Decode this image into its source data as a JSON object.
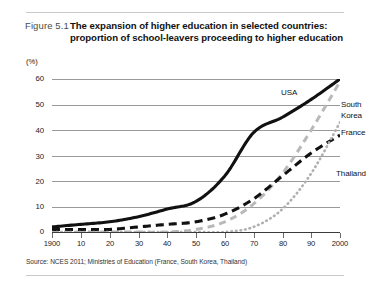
{
  "figure": {
    "number": "Figure 5.1",
    "title_line1": "The expansion of higher education in selected countries:",
    "title_line2": "proportion of school-leavers proceeding to higher education",
    "source": "Source: NCES 2011; Ministries of Education (France, South Korea, Thailand)"
  },
  "chart_data": {
    "type": "line",
    "xlabel": "",
    "ylabel": "(%)",
    "y_unit": "(%)",
    "xlim": [
      1900,
      2000
    ],
    "ylim": [
      0,
      60
    ],
    "grid": true,
    "legend_position": "inline-right",
    "yticks": [
      0,
      10,
      20,
      30,
      40,
      50,
      60
    ],
    "ytick_labels": [
      "0",
      "10",
      "20",
      "30",
      "40",
      "50",
      "60"
    ],
    "xticks": [
      1900,
      1910,
      1920,
      1930,
      1940,
      1950,
      1960,
      1970,
      1980,
      1990,
      2000
    ],
    "xtick_labels": [
      "1900",
      "10",
      "20",
      "30",
      "40",
      "50",
      "60",
      "70",
      "80",
      "90",
      "2000"
    ],
    "series": [
      {
        "name": "USA",
        "style": "solid",
        "color": "#111111",
        "x": [
          1900,
          1910,
          1920,
          1930,
          1940,
          1950,
          1960,
          1970,
          1980,
          1990,
          2000
        ],
        "values": [
          2,
          3,
          4,
          6,
          9,
          12,
          22,
          39,
          45,
          52,
          60
        ]
      },
      {
        "name": "South Korea",
        "style": "dashed",
        "color": "#b5b5b5",
        "x": [
          1900,
          1910,
          1920,
          1930,
          1940,
          1950,
          1960,
          1970,
          1980,
          1990,
          2000
        ],
        "values": [
          0,
          0,
          0,
          0,
          0,
          1,
          4,
          11,
          23,
          40,
          59
        ]
      },
      {
        "name": "France",
        "style": "dashed",
        "color": "#111111",
        "x": [
          1900,
          1910,
          1920,
          1930,
          1940,
          1950,
          1960,
          1970,
          1980,
          1990,
          2000
        ],
        "values": [
          1,
          1,
          1,
          2,
          3,
          4,
          7,
          13,
          22,
          31,
          38
        ]
      },
      {
        "name": "Thailand",
        "style": "dotted",
        "color": "#aaaaaa",
        "x": [
          1900,
          1910,
          1920,
          1930,
          1940,
          1950,
          1960,
          1970,
          1980,
          1990,
          2000
        ],
        "values": [
          0,
          0,
          0,
          0,
          0,
          0,
          0,
          2,
          9,
          23,
          43
        ]
      }
    ]
  },
  "series_labels": {
    "usa": "USA",
    "south_korea_line1": "South",
    "south_korea_line2": "Korea",
    "france": "France",
    "thailand": "Thailand"
  }
}
